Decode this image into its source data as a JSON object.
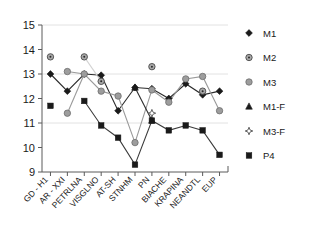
{
  "chart_data": {
    "type": "line",
    "title": "",
    "xlabel": "",
    "ylabel": "",
    "ylim": [
      9,
      15
    ],
    "yticks": [
      9,
      10,
      11,
      12,
      13,
      14,
      15
    ],
    "grid": true,
    "gridlines_at": [
      11,
      13,
      15
    ],
    "legend_position": "right",
    "categories": [
      "GD - H1",
      "AR - XXI",
      "PETRLNA",
      "VISGLNO",
      "AT-SH",
      "STNHM",
      "PN",
      "BIACHE",
      "KRAPINA",
      "NEANDTL",
      "EUP"
    ],
    "series": [
      {
        "name": "M1",
        "marker": "filled-diamond",
        "color": "#1a1a1a",
        "line_color": "#2b2b2b",
        "values": [
          13.0,
          12.3,
          13.0,
          12.95,
          11.5,
          12.45,
          12.4,
          12.0,
          12.6,
          12.15,
          12.3
        ]
      },
      {
        "name": "M2",
        "marker": "dotted-circle",
        "color": "#8c8c8c",
        "line_color": "#d2d2d2",
        "values": [
          13.7,
          null,
          13.7,
          12.7,
          null,
          null,
          13.3,
          null,
          null,
          12.3,
          null
        ]
      },
      {
        "name": "M3",
        "marker": "gray-circle",
        "color": "#8c8c8c",
        "line_color": "#9a9a9a",
        "values": [
          null,
          13.1,
          13.0,
          12.3,
          12.1,
          10.2,
          12.35,
          11.85,
          12.8,
          12.9,
          11.5
        ]
      },
      {
        "name": "M1-F",
        "marker": "filled-triangle",
        "color": "#1a1a1a",
        "line_color": "#2b2b2b",
        "values": [
          null,
          null,
          null,
          null,
          null,
          12.45,
          11.1,
          null,
          null,
          null,
          null
        ]
      },
      {
        "name": "M3-F",
        "marker": "open-star",
        "color": "#6e6e6e",
        "line_color": "#8a8a8a",
        "values": [
          null,
          null,
          null,
          null,
          null,
          null,
          11.4,
          null,
          null,
          null,
          null
        ]
      },
      {
        "name": "P4",
        "marker": "filled-square",
        "color": "#1a1a1a",
        "line_color": "#3a3a3a",
        "values": [
          11.7,
          null,
          11.9,
          10.9,
          10.4,
          9.3,
          11.1,
          10.7,
          10.9,
          10.7,
          9.7
        ]
      }
    ],
    "extra_points": [
      {
        "series": "M3",
        "category_index": 1,
        "value": 11.4
      }
    ]
  },
  "legend": {
    "items": [
      {
        "label": "M1",
        "marker": "filled-diamond"
      },
      {
        "label": "M2",
        "marker": "dotted-circle"
      },
      {
        "label": "M3",
        "marker": "gray-circle"
      },
      {
        "label": "M1-F",
        "marker": "filled-triangle"
      },
      {
        "label": "M3-F",
        "marker": "open-star"
      },
      {
        "label": "P4",
        "marker": "filled-square"
      }
    ]
  }
}
